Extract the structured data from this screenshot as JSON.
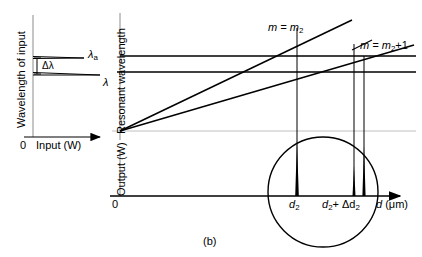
{
  "figure": {
    "caption": "(b)"
  },
  "left_panel": {
    "y_axis_label": "Wavelength of input",
    "x_axis_label": "Input (W)",
    "x_origin_label": "0",
    "upper_line_label": "λ",
    "upper_line_sub": "a",
    "lower_line_label": "λ",
    "gap_label": "Δλ",
    "lines": [
      {
        "name": "lambda-a",
        "y": 57,
        "x_start": 33,
        "x_end": 82
      },
      {
        "name": "lambda",
        "y": 73,
        "x_start": 33,
        "x_end": 98
      }
    ]
  },
  "middle_panel": {
    "y_axis_label": "Resonant wavelength",
    "mode_label_1": "m = m",
    "mode_label_1_sub": "2",
    "mode_label_2": "m = m",
    "mode_label_2_sub": "2",
    "mode_label_2_tail": "+1",
    "horizontal_lines": [
      {
        "name": "resonance-level-upper",
        "y": 56
      },
      {
        "name": "resonance-level-lower",
        "y": 72
      }
    ],
    "diagonal_lines": [
      {
        "name": "mode-line-m2",
        "x1": 120,
        "y1": 131,
        "x2": 350,
        "y2": 22
      },
      {
        "name": "mode-line-m2-plus-1",
        "x1": 120,
        "y1": 131,
        "x2": 410,
        "y2": 46
      }
    ],
    "drop_lines": [
      {
        "name": "dropline-d2",
        "x": 297
      },
      {
        "name": "dropline-d2-delta-a",
        "x": 354
      },
      {
        "name": "dropline-d2-delta-b",
        "x": 364
      }
    ]
  },
  "bottom_panel": {
    "y_axis_label": "Output (W)",
    "x_axis_label": "d",
    "x_axis_units": "(μm)",
    "x_origin_label": "0",
    "tick_label_1": "d",
    "tick_label_1_sub": "2",
    "tick_label_2_a": "d",
    "tick_label_2_a_sub": "2",
    "tick_label_2_mid": "+ Δd",
    "tick_label_2_sub": "2",
    "peaks": [
      {
        "name": "peak-d2",
        "x": 297,
        "height": 56
      },
      {
        "name": "peak-mid",
        "x": 354,
        "height": 30
      },
      {
        "name": "peak-d2-delta",
        "x": 364,
        "height": 50
      }
    ],
    "magnifier": {
      "name": "magnifier-circle",
      "cx": 323,
      "cy": 192,
      "r": 55
    }
  },
  "colors": {
    "stroke": "#000000",
    "axis": "#808080",
    "background": "#ffffff"
  }
}
